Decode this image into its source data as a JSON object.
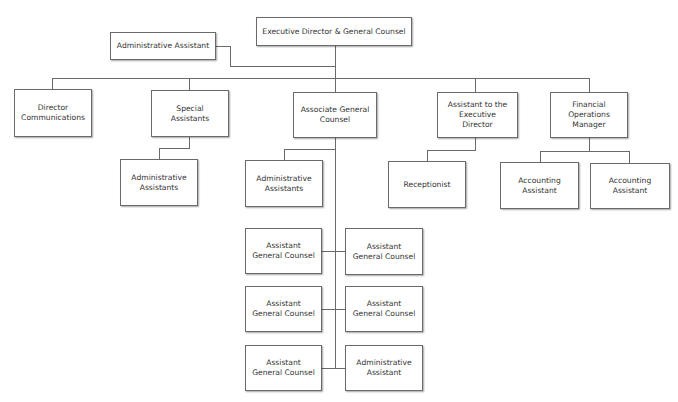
{
  "diagram": {
    "type": "org-chart",
    "nodes": {
      "exec": {
        "label": "Executive Director & General Counsel"
      },
      "admin_top": {
        "label": "Administrative Assistant"
      },
      "dir_comm": {
        "label": "Director\nCommunications"
      },
      "special": {
        "label": "Special\nAssistants"
      },
      "agc": {
        "label": "Associate General\nCounsel"
      },
      "asst_exec": {
        "label": "Assistant to the\nExecutive\nDirector"
      },
      "fin_ops": {
        "label": "Financial\nOperations\nManager"
      },
      "special_admin": {
        "label": "Administrative\nAssistants"
      },
      "agc_admin": {
        "label": "Administrative\nAssistants"
      },
      "receptionist": {
        "label": "Receptionist"
      },
      "acct1": {
        "label": "Accounting\nAssistant"
      },
      "acct2": {
        "label": "Accounting\nAssistant"
      },
      "agc_l1": {
        "label": "Assistant\nGeneral Counsel"
      },
      "agc_r1": {
        "label": "Assistant\nGeneral Counsel"
      },
      "agc_l2": {
        "label": "Assistant\nGeneral Counsel"
      },
      "agc_r2": {
        "label": "Assistant\nGeneral Counsel"
      },
      "agc_l3": {
        "label": "Assistant\nGeneral Counsel"
      },
      "agc_r3": {
        "label": "Administrative\nAssistant"
      }
    },
    "edges": [
      [
        "exec",
        "admin_top"
      ],
      [
        "exec",
        "dir_comm"
      ],
      [
        "exec",
        "special"
      ],
      [
        "exec",
        "agc"
      ],
      [
        "exec",
        "asst_exec"
      ],
      [
        "exec",
        "fin_ops"
      ],
      [
        "special",
        "special_admin"
      ],
      [
        "agc",
        "agc_admin"
      ],
      [
        "agc",
        "agc_l1"
      ],
      [
        "agc",
        "agc_r1"
      ],
      [
        "agc",
        "agc_l2"
      ],
      [
        "agc",
        "agc_r2"
      ],
      [
        "agc",
        "agc_l3"
      ],
      [
        "agc",
        "agc_r3"
      ],
      [
        "asst_exec",
        "receptionist"
      ],
      [
        "fin_ops",
        "acct1"
      ],
      [
        "fin_ops",
        "acct2"
      ]
    ],
    "colors": {
      "line": "#6a6a6a",
      "box_border": "#6a6a6a",
      "text": "#333333"
    }
  }
}
